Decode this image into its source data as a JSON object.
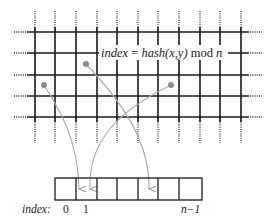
{
  "diagram": {
    "formula": {
      "prefix": "index",
      "equals": " = ",
      "func": "hash",
      "args": "(x,y)",
      "op": " mod ",
      "modulus": "n"
    },
    "array": {
      "row_label": "index:",
      "cell_count": 7,
      "index_labels": [
        {
          "text": "0",
          "cell": 0
        },
        {
          "text": "1",
          "cell": 1
        },
        {
          "text": "n−1",
          "cell": 6
        }
      ]
    },
    "grid": {
      "columns": 11,
      "rows": 5,
      "continues_beyond_edges": true
    },
    "points": [
      {
        "id": "p1",
        "x": 44,
        "y": 85,
        "maps_to_cell": 1
      },
      {
        "id": "p2",
        "x": 86,
        "y": 64,
        "maps_to_cell": 4
      },
      {
        "id": "p3",
        "x": 171,
        "y": 85,
        "maps_to_cell": 1
      }
    ],
    "colors": {
      "grid": "#1a1a1a",
      "arrow": "#a0a0a0",
      "point": "#8c8c8c",
      "text": "#222222"
    }
  }
}
